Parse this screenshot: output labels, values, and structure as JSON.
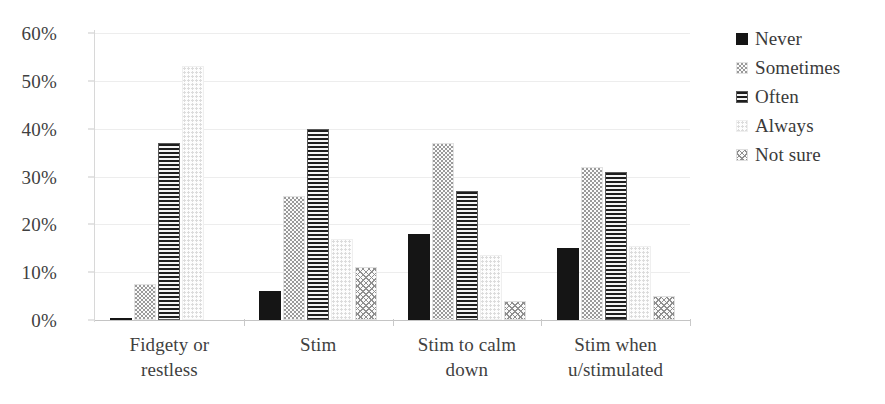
{
  "chart_data": {
    "type": "bar",
    "title": "",
    "subtitle": "",
    "xlabel": "",
    "ylabel": "",
    "ylim": [
      0,
      60
    ],
    "ytick_values": [
      0,
      10,
      20,
      30,
      40,
      50,
      60
    ],
    "ytick_labels": [
      "0%",
      "10%",
      "20%",
      "30%",
      "40%",
      "50%",
      "60%"
    ],
    "grid": true,
    "legend_position": "right",
    "units": "percent",
    "categories": [
      "Fidgety or\nrestless",
      "Stim",
      "Stim to calm\ndown",
      "Stim when\nu/stimulated"
    ],
    "series": [
      {
        "name": "Never",
        "pattern": "solid-black",
        "values": [
          0.5,
          6,
          18,
          15
        ]
      },
      {
        "name": "Sometimes",
        "pattern": "light-dotted",
        "values": [
          7.5,
          26,
          37,
          32
        ]
      },
      {
        "name": "Often",
        "pattern": "horizontal-lines",
        "values": [
          37,
          40,
          27,
          31
        ]
      },
      {
        "name": "Always",
        "pattern": "very-light-dots",
        "values": [
          53,
          17,
          13.5,
          15.5
        ]
      },
      {
        "name": "Not sure",
        "pattern": "cross-hatch",
        "values": [
          0,
          11,
          4,
          5
        ]
      }
    ]
  },
  "legend": {
    "items": [
      {
        "label": "Never",
        "swatch": "legend-swatch-never"
      },
      {
        "label": "Sometimes",
        "swatch": "legend-swatch-sometimes"
      },
      {
        "label": "Often",
        "swatch": "legend-swatch-often"
      },
      {
        "label": "Always",
        "swatch": "legend-swatch-always"
      },
      {
        "label": "Not sure",
        "swatch": "legend-swatch-not-sure"
      }
    ]
  },
  "colors": {
    "never": "#151515",
    "often_line": "#1d1d1d",
    "sometimes_dot": "#9a9a9a",
    "always_dot": "#dcdcdc",
    "not_sure_hatch": "#8f8f8f",
    "gridline": "#ededed",
    "axis": "#c4c4c4",
    "text": "#3a3a3a",
    "background": "#ffffff"
  }
}
